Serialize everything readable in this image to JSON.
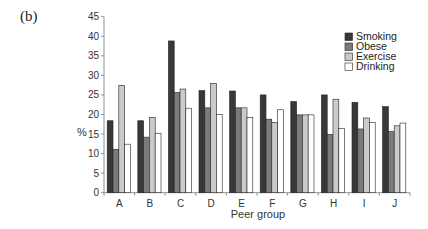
{
  "panel_label": "(b)",
  "chart_data": {
    "type": "bar",
    "title": "",
    "xlabel": "Peer group",
    "ylabel": "%",
    "ylim": [
      0,
      45
    ],
    "yticks": [
      0,
      5,
      10,
      15,
      20,
      25,
      30,
      35,
      40,
      45
    ],
    "grid": false,
    "legend_position": "top-right",
    "categories": [
      "A",
      "B",
      "C",
      "D",
      "E",
      "F",
      "G",
      "H",
      "I",
      "J"
    ],
    "series": [
      {
        "name": "Smoking",
        "color": "#383838",
        "values": [
          18.4,
          18.4,
          38.8,
          26.1,
          26.0,
          25.0,
          23.3,
          25.0,
          23.1,
          22.0
        ]
      },
      {
        "name": "Obese",
        "color": "#7b7b7b",
        "values": [
          11.1,
          14.2,
          25.6,
          21.7,
          21.7,
          18.8,
          19.9,
          14.9,
          16.3,
          15.6
        ]
      },
      {
        "name": "Exercise",
        "color": "#cacaca",
        "values": [
          27.4,
          19.2,
          26.5,
          27.9,
          21.7,
          18.0,
          19.9,
          23.9,
          19.1,
          17.1
        ]
      },
      {
        "name": "Drinking",
        "color": "#ffffff",
        "values": [
          12.4,
          15.2,
          21.6,
          20.0,
          19.2,
          21.2,
          19.9,
          16.4,
          17.9,
          17.8
        ]
      }
    ]
  }
}
